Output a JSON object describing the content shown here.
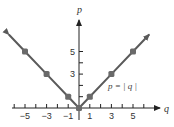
{
  "chart_data": {
    "type": "line",
    "title": "",
    "xlabel": "q",
    "ylabel": "p",
    "annotation": "p = | q |",
    "x_ticks": [
      -6,
      -5,
      -4,
      -3,
      -2,
      -1,
      1,
      2,
      3,
      4,
      5,
      6
    ],
    "x_tick_labels": [
      "-5",
      "-3",
      "-1",
      "1",
      "3",
      "5"
    ],
    "y_ticks": [
      1,
      2,
      3,
      4,
      5
    ],
    "y_tick_labels": [
      "3",
      "5"
    ],
    "xlim": [
      -6.5,
      6.5
    ],
    "ylim": [
      0,
      8
    ],
    "grid": false,
    "legend": "none",
    "series": [
      {
        "name": "p = |q|",
        "x": [
          -6.5,
          -5,
          -3,
          -1,
          0,
          1,
          3,
          5,
          6.5
        ],
        "values": [
          6.5,
          5,
          3,
          1,
          0,
          1,
          3,
          5,
          6.5
        ],
        "markers_at": [
          -5,
          -3,
          -1,
          0,
          1,
          3,
          5
        ],
        "arrows_at_ends": true
      }
    ],
    "colors": {
      "line": "#5a5a5a",
      "marker": "#6a6a6a",
      "axis": "#222222"
    }
  }
}
